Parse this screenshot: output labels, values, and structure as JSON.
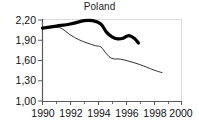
{
  "chart_data": {
    "type": "line",
    "title": "Poland",
    "xlabel": "",
    "ylabel": "",
    "xlim": [
      1990,
      2000
    ],
    "ylim": [
      1.0,
      2.2
    ],
    "grid": false,
    "legend": "none",
    "y_ticks": [
      "1,00",
      "1,30",
      "1,60",
      "1,90",
      "2,20"
    ],
    "y_tick_values": [
      1.0,
      1.3,
      1.6,
      1.9,
      2.2
    ],
    "x_ticks": [
      "1990",
      "1992",
      "1994",
      "1996",
      "1998",
      "2000"
    ],
    "x_tick_values": [
      1990,
      1992,
      1994,
      1996,
      1998,
      2000
    ],
    "x_minor_ticks": [
      1991,
      1993,
      1995,
      1997,
      1999
    ],
    "decimal_separator": ",",
    "series": [
      {
        "name": "thick-line",
        "style": "thick-solid-black",
        "color": "#000000",
        "width": 3.2,
        "x": [
          1990,
          1991,
          1992,
          1993,
          1993.6,
          1994.2,
          1994.6,
          1995.0,
          1995.4,
          1995.8,
          1996.2,
          1996.6,
          1996.9
        ],
        "values": [
          2.08,
          2.11,
          2.14,
          2.19,
          2.19,
          2.14,
          2.02,
          1.95,
          1.92,
          1.93,
          1.97,
          1.93,
          1.86
        ]
      },
      {
        "name": "thin-line",
        "style": "thin-solid-black",
        "color": "#1a1a1a",
        "width": 0.9,
        "x": [
          1990,
          1991,
          1991.4,
          1992,
          1992.6,
          1993.2,
          1993.8,
          1994.2,
          1994.6,
          1995.0,
          1995.6,
          1996.2,
          1997.0,
          1998.0,
          1998.6
        ],
        "values": [
          2.08,
          2.09,
          2.07,
          1.98,
          1.91,
          1.86,
          1.82,
          1.8,
          1.7,
          1.63,
          1.62,
          1.59,
          1.54,
          1.46,
          1.42
        ]
      }
    ]
  },
  "axes": {
    "frame_color": "#d8d8d8",
    "axis_color": "#5a5a5a",
    "tick_color": "#5a5a5a"
  }
}
